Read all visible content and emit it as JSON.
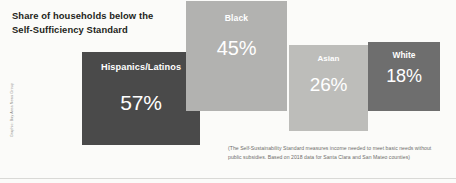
{
  "title": "Share of households below the\nSelf-Sufficiency Standard",
  "credit": "Graphic: Bay Area News Group",
  "footnote": "(The Self-Sustainability Standard measures income needed to meet basic needs without public subsidies. Based on 2018 data for Santa Clara and San Mateo counties)",
  "colors": {
    "background": "#fbfbf9",
    "hispanics": "#4a4a4a",
    "black": "#b2b2b0",
    "asian": "#bdbdba",
    "white_group": "#6e6e6e",
    "title_text": "#231f20",
    "footnote_text": "#6d6d6a"
  },
  "chart_data": {
    "type": "bar",
    "title": "Share of households below the Self-Sufficiency Standard",
    "xlabel": "",
    "ylabel": "Share of households (%)",
    "ylim": [
      0,
      60
    ],
    "unit": "%",
    "grid": false,
    "legend": "none",
    "categories": [
      "Hispanics/Latinos",
      "Black",
      "Asian",
      "White"
    ],
    "values": [
      57,
      26,
      26,
      18
    ],
    "labels": [
      "57%",
      "45%",
      "26%",
      "18%"
    ],
    "annotation": "(The Self-Sustainability Standard measures income needed to meet basic needs without public subsidies. Based on 2018 data for Santa Clara and San Mateo counties)",
    "bars": [
      {
        "category": "Hispanics/Latinos",
        "value": 57,
        "label": "57%",
        "color": "#4a4a4a"
      },
      {
        "category": "Black",
        "value": 45,
        "label": "45%",
        "color": "#b2b2b0"
      },
      {
        "category": "Asian",
        "value": 26,
        "label": "26%",
        "color": "#bdbdba"
      },
      {
        "category": "White",
        "value": 18,
        "label": "18%",
        "color": "#6e6e6e"
      }
    ]
  }
}
